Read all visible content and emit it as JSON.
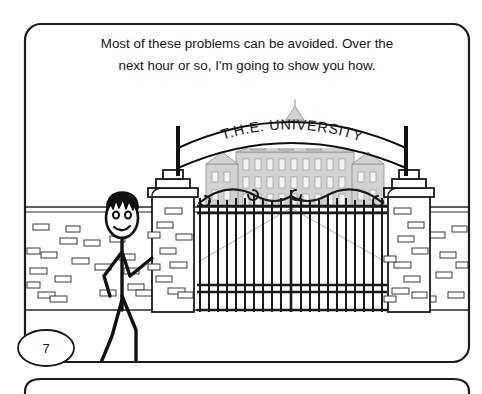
{
  "panel": {
    "caption_line1": "Most of these problems can be avoided.  Over the",
    "caption_line2": "next hour or so, I'm going to show you how.",
    "page_number": "7",
    "border_color": "#1b1b1b",
    "background_color": "#ffffff"
  },
  "scene": {
    "name": "university-gate-scene",
    "arch_sign_text": "T.H.E. UNIVERSITY",
    "character": {
      "name": "stick-figure-presenter",
      "hair_color": "#111111",
      "line_color": "#111111",
      "expression": "smiling"
    },
    "gate": {
      "name": "wrought-iron-gate",
      "bar_color": "#1a1a1a",
      "bar_count": 21
    },
    "building": {
      "name": "university-building",
      "fill_color": "#c9c9c9",
      "outline_color": "#8f8f8f"
    },
    "wall": {
      "name": "brick-wall",
      "outline_color": "#2a2a2a",
      "brick_color": "#3a3a3a"
    },
    "pillars": {
      "left_name": "left-gate-pillar",
      "right_name": "right-gate-pillar",
      "outline_color": "#1b1b1b"
    }
  },
  "next_panel": {
    "label": "next-comic-panel",
    "border_color": "#1b1b1b"
  }
}
